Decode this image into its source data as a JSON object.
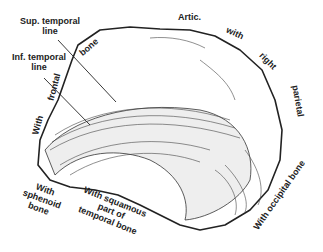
{
  "figure": {
    "labels": {
      "sup_temporal_line": [
        "Sup. temporal",
        "line"
      ],
      "inf_temporal_line": [
        "Inf. temporal",
        "line"
      ],
      "artic": "Artic.",
      "with_right": "with",
      "right": "right",
      "parietal": "parietal",
      "bone_top": "bone",
      "frontal": "frontal",
      "with_left": "With",
      "sphenoid": [
        "With",
        "sphenoid",
        "bone"
      ],
      "squamous": [
        "With squamous",
        "part of",
        "temporal bone"
      ],
      "occipital": "With occipital bone"
    }
  }
}
